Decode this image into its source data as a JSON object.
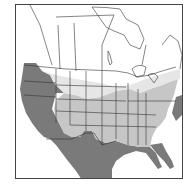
{
  "map": {
    "type": "species-range-map",
    "region": "North America",
    "legend_visible": false,
    "colors": {
      "background": "#ffffff",
      "frame": "#444444",
      "boundary_lines": "#333333",
      "range_primary": "#7a7a7a",
      "range_secondary": "#c6c6c6",
      "range_tertiary_light": "#e6e6e6"
    },
    "zones": [
      {
        "name": "dark-gray-range",
        "description": "Pacific coast, Great Basin, Southwest, Mexico, Gulf coast, Florida, mid-Atlantic coast"
      },
      {
        "name": "light-gray-range",
        "description": "Central and eastern United States"
      },
      {
        "name": "faint-range",
        "description": "Northern plains and southern Canada border, Northeast"
      }
    ]
  }
}
